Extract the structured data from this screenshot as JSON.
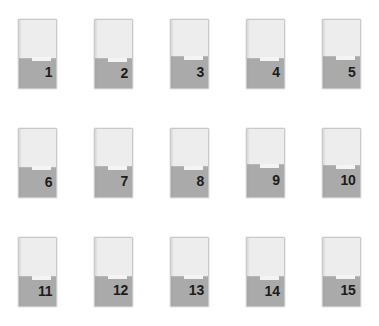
{
  "canvas": {
    "width": 379,
    "height": 326,
    "background": "#ffffff",
    "title": "Numbered card grid"
  },
  "palette": {
    "card_empty": "#ededed",
    "card_fill": "#aaaaaa",
    "card_border": "#c9c9c9",
    "stripe": "#f4f4f4",
    "number_text": "#1c1c1c",
    "background": "#ffffff"
  },
  "grid": {
    "columns": 5,
    "rows": 3,
    "count": 15,
    "card_width": 39,
    "card_height": 70
  },
  "cards": [
    {
      "id": 1,
      "label": "1",
      "fill_percent": 45,
      "stripe_top_percent": 54,
      "number_top_percent": 66
    },
    {
      "id": 2,
      "label": "2",
      "fill_percent": 44,
      "stripe_top_percent": 55,
      "number_top_percent": 67
    },
    {
      "id": 3,
      "label": "3",
      "fill_percent": 47,
      "stripe_top_percent": 53,
      "number_top_percent": 65
    },
    {
      "id": 4,
      "label": "4",
      "fill_percent": 45,
      "stripe_top_percent": 54,
      "number_top_percent": 66
    },
    {
      "id": 5,
      "label": "5",
      "fill_percent": 47,
      "stripe_top_percent": 53,
      "number_top_percent": 65
    },
    {
      "id": 6,
      "label": "6",
      "fill_percent": 44,
      "stripe_top_percent": 55,
      "number_top_percent": 67
    },
    {
      "id": 7,
      "label": "7",
      "fill_percent": 46,
      "stripe_top_percent": 54,
      "number_top_percent": 66
    },
    {
      "id": 8,
      "label": "8",
      "fill_percent": 46,
      "stripe_top_percent": 54,
      "number_top_percent": 66
    },
    {
      "id": 9,
      "label": "9",
      "fill_percent": 48,
      "stripe_top_percent": 52,
      "number_top_percent": 64
    },
    {
      "id": 10,
      "label": "10",
      "fill_percent": 47,
      "stripe_top_percent": 53,
      "number_top_percent": 65
    },
    {
      "id": 11,
      "label": "11",
      "fill_percent": 43,
      "stripe_top_percent": 56,
      "number_top_percent": 68
    },
    {
      "id": 12,
      "label": "12",
      "fill_percent": 44,
      "stripe_top_percent": 55,
      "number_top_percent": 67
    },
    {
      "id": 13,
      "label": "13",
      "fill_percent": 44,
      "stripe_top_percent": 55,
      "number_top_percent": 67
    },
    {
      "id": 14,
      "label": "14",
      "fill_percent": 43,
      "stripe_top_percent": 56,
      "number_top_percent": 68
    },
    {
      "id": 15,
      "label": "15",
      "fill_percent": 44,
      "stripe_top_percent": 55,
      "number_top_percent": 67
    }
  ]
}
